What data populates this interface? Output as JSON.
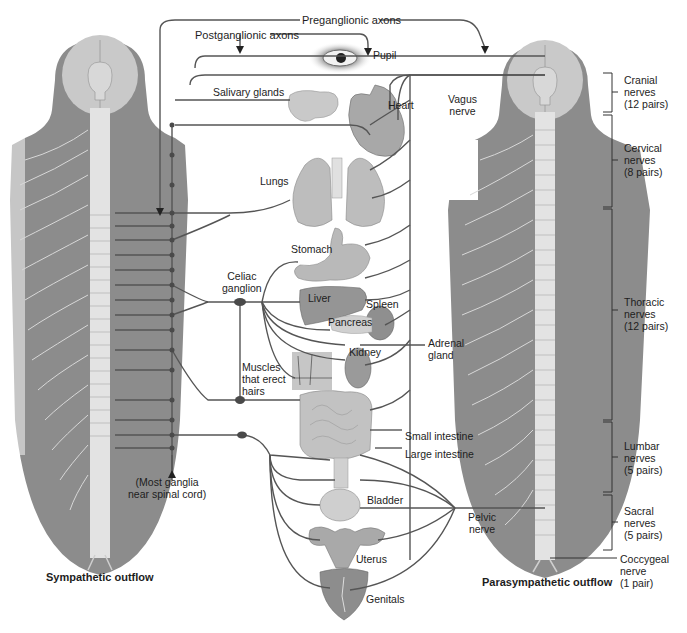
{
  "labels": {
    "preganglionic": "Preganglionic axons",
    "postganglionic": "Postganglionic axons",
    "pupil": "Pupil",
    "salivary": "Salivary glands",
    "heart": "Heart",
    "vagus_1": "Vagus",
    "vagus_2": "nerve",
    "lungs": "Lungs",
    "stomach": "Stomach",
    "celiac_1": "Celiac",
    "celiac_2": "ganglion",
    "liver": "Liver",
    "spleen": "Spleen",
    "pancreas": "Pancreas",
    "adrenal_1": "Adrenal",
    "adrenal_2": "gland",
    "kidney": "Kidney",
    "muscles_1": "Muscles",
    "muscles_2": "that erect",
    "muscles_3": "hairs",
    "small_intestine": "Small intestine",
    "large_intestine": "Large intestine",
    "ganglia_1": "(Most ganglia",
    "ganglia_2": "near spinal cord)",
    "bladder": "Bladder",
    "pelvic_1": "Pelvic",
    "pelvic_2": "nerve",
    "uterus": "Uterus",
    "genitals": "Genitals",
    "sympathetic": "Sympathetic outflow",
    "parasympathetic": "Parasympathetic outflow"
  },
  "nerve_groups": [
    {
      "name": "Cranial",
      "line2": "nerves",
      "count": "(12 pairs)"
    },
    {
      "name": "Cervical",
      "line2": "nerves",
      "count": "(8 pairs)"
    },
    {
      "name": "Thoracic",
      "line2": "nerves",
      "count": "(12 pairs)"
    },
    {
      "name": "Lumbar",
      "line2": "nerves",
      "count": "(5 pairs)"
    },
    {
      "name": "Sacral",
      "line2": "nerves",
      "count": "(5 pairs)"
    },
    {
      "name": "Coccygeal",
      "line2": "nerve",
      "count": "(1 pair)"
    }
  ],
  "colors": {
    "body": "#8a8a8a",
    "head": "#c8c8c8",
    "spine": "#e2e2e2",
    "nerve": "#555555",
    "organ": "#b5b5b5",
    "organ_dark": "#8f8f8f"
  }
}
